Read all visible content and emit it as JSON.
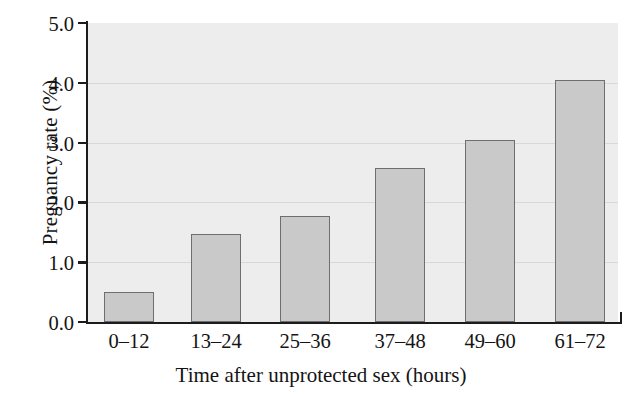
{
  "chart_data": {
    "type": "bar",
    "title": "",
    "xlabel": "Time after unprotected sex (hours)",
    "ylabel": "Pregnancy rate (%)",
    "categories": [
      "0–12",
      "13–24",
      "25–36",
      "37–48",
      "49–60",
      "61–72"
    ],
    "values": [
      0.5,
      1.47,
      1.78,
      2.57,
      3.04,
      4.04
    ],
    "ylim": [
      0.0,
      5.0
    ],
    "ytick_labels": [
      "0.0",
      "1.0",
      "2.0",
      "3.0",
      "4.0",
      "5.0"
    ],
    "ytick_values": [
      0.0,
      1.0,
      2.0,
      3.0,
      4.0,
      5.0
    ],
    "gridlines_at": [
      1.0,
      2.0,
      3.0,
      4.0
    ],
    "grid": true,
    "legend": "none",
    "series": [
      {
        "name": "Pregnancy rate",
        "values": [
          0.5,
          1.47,
          1.78,
          2.57,
          3.04,
          4.04
        ]
      }
    ],
    "colors": {
      "bar_fill": "#c9c9c9",
      "bar_border": "#6e6e6e",
      "plot_background": "#ededed",
      "gridline": "#d8d8d8",
      "axis": "#1c1c1c",
      "text": "#141414",
      "page_background": "#ffffff"
    }
  }
}
